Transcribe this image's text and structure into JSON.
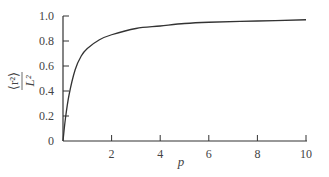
{
  "chart_data": {
    "type": "line",
    "title": "",
    "xlabel": "p",
    "ylabel": "⟨r²⟩ / L²",
    "ylabel_num": "⟨r²⟩",
    "ylabel_den": "L²",
    "xlim": [
      0,
      10
    ],
    "ylim": [
      0,
      1.0
    ],
    "grid": false,
    "legend": null,
    "x_ticks": [
      "2",
      "4",
      "6",
      "8",
      "10"
    ],
    "y_ticks": [
      "0",
      "0.2",
      "0.4",
      "0.6",
      "0.8",
      "1.0"
    ],
    "series": [
      {
        "name": "<r^2>/L^2",
        "x": [
          0,
          0.1,
          0.25,
          0.5,
          0.75,
          1,
          1.5,
          2,
          3,
          4,
          5,
          6,
          8,
          10
        ],
        "values": [
          0,
          0.18,
          0.37,
          0.57,
          0.68,
          0.74,
          0.81,
          0.85,
          0.9,
          0.92,
          0.94,
          0.95,
          0.96,
          0.97
        ]
      }
    ]
  }
}
